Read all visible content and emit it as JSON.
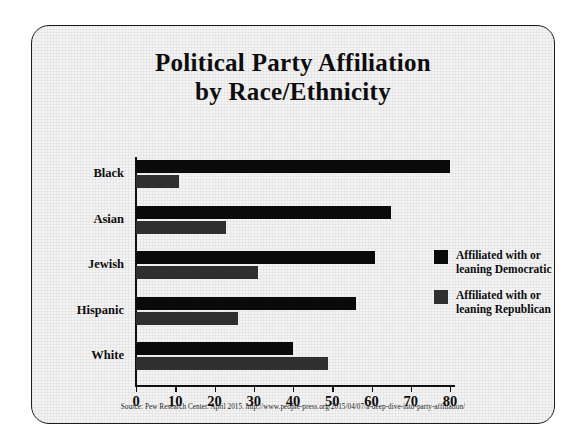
{
  "chart_data": {
    "type": "bar",
    "orientation": "horizontal",
    "title": "Political Party Affiliation by Race/Ethnicity",
    "title_line1": "Political Party Affiliation",
    "title_line2": "by Race/Ethnicity",
    "categories": [
      "Black",
      "Asian",
      "Jewish",
      "Hispanic",
      "White"
    ],
    "series": [
      {
        "name": "Affiliated with or leaning Democratic",
        "name_line1": "Affiliated with or",
        "name_line2": "leaning Democratic",
        "color": "#0a0a0a",
        "values": [
          80,
          65,
          61,
          56,
          40
        ]
      },
      {
        "name": "Affiliated with or leaning Republican",
        "name_line1": "Affiliated with or",
        "name_line2": "leaning Republican",
        "color": "#2f2f2f",
        "values": [
          11,
          23,
          31,
          26,
          49
        ]
      }
    ],
    "xlabel": "",
    "ylabel": "",
    "xlim": [
      0,
      80
    ],
    "xticks": [
      0,
      10,
      20,
      30,
      40,
      50,
      60,
      70,
      80
    ],
    "xtick_labels": [
      "0",
      "10",
      "20",
      "30",
      "40",
      "50",
      "60",
      "70",
      "80"
    ],
    "grid": false,
    "legend_position": "right"
  },
  "source": {
    "text": "Source: Pew Research Center. April 2015. http://www.people-press.org/2015/04/07/a-deep-dive-into-party-affiliation/"
  },
  "colors": {
    "democratic": "#0a0a0a",
    "republican": "#2f2f2f",
    "frame_border": "#1b1b1b",
    "slide_background": "#f3f3f3",
    "page_background": "#ffffff",
    "text": "#0d0d0d"
  }
}
